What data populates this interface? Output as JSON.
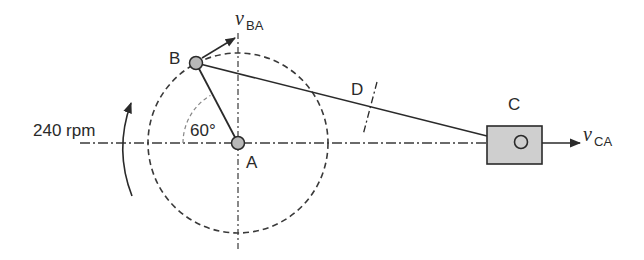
{
  "diagram": {
    "type": "slider-crank mechanism",
    "labels": {
      "point_a": "A",
      "point_b": "B",
      "point_c": "C",
      "point_d": "D",
      "angle": "60°",
      "speed": "240 rpm",
      "v_ba_main": "v",
      "v_ba_sub": "BA",
      "v_ca_main": "v",
      "v_ca_sub": "CA"
    },
    "colors": {
      "line": "#2a2a2a",
      "joint_fill": "#b8b8b8",
      "slider_fill": "#cfcfcf"
    }
  }
}
